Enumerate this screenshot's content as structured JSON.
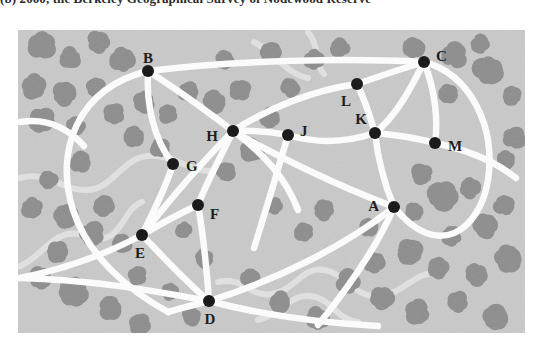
{
  "caption": "(b)  2000, the Berkeley Geographical Survey of Nodewood Reserve",
  "colors": {
    "page_background": "#ffffff",
    "map_background": "#c9c9c9",
    "road": "#ffffff",
    "stream": "#e2e2e2",
    "tree": "#8d8d8d",
    "node": "#101010",
    "label": "#141414"
  },
  "map": {
    "title": "road-network-map",
    "width": 507,
    "height": 303,
    "nodes": [
      {
        "id": "A",
        "label": "A",
        "x": 376,
        "y": 177,
        "label_dx": -15,
        "label_dy": 1,
        "degree": 5
      },
      {
        "id": "B",
        "label": "B",
        "x": 130,
        "y": 41,
        "label_dx": 0,
        "label_dy": -11,
        "degree": 4
      },
      {
        "id": "C",
        "label": "C",
        "x": 406,
        "y": 32,
        "label_dx": 12,
        "label_dy": -4,
        "degree": 5
      },
      {
        "id": "D",
        "label": "D",
        "x": 191,
        "y": 271,
        "label_dx": 1,
        "label_dy": 20,
        "degree": 4
      },
      {
        "id": "E",
        "label": "E",
        "x": 124,
        "y": 205,
        "label_dx": -2,
        "label_dy": 20,
        "degree": 5
      },
      {
        "id": "F",
        "label": "F",
        "x": 180,
        "y": 175,
        "label_dx": 12,
        "label_dy": 11,
        "degree": 2
      },
      {
        "id": "G",
        "label": "G",
        "x": 155,
        "y": 134,
        "label_dx": 13,
        "label_dy": 4,
        "degree": 2
      },
      {
        "id": "H",
        "label": "H",
        "x": 215,
        "y": 101,
        "label_dx": -15,
        "label_dy": 7,
        "degree": 7
      },
      {
        "id": "J",
        "label": "J",
        "x": 270,
        "y": 105,
        "label_dx": 12,
        "label_dy": -2,
        "degree": 3
      },
      {
        "id": "K",
        "label": "K",
        "x": 357,
        "y": 103,
        "label_dx": -8,
        "label_dy": -12,
        "degree": 4
      },
      {
        "id": "L",
        "label": "L",
        "x": 339,
        "y": 54,
        "label_dx": -6,
        "label_dy": 19,
        "degree": 3
      },
      {
        "id": "M",
        "label": "M",
        "x": 417,
        "y": 113,
        "label_dx": 13,
        "label_dy": 5,
        "degree": 3
      }
    ],
    "roads": [
      {
        "name": "B-H",
        "d": "M130,41 C160,60 190,82 215,101"
      },
      {
        "name": "B-C",
        "d": "M130,41 C220,30 330,28 406,32"
      },
      {
        "name": "B-E-arc",
        "d": "M130,41 C60,58 36,120 55,180 C70,226 110,260 150,282"
      },
      {
        "name": "B-G-E",
        "d": "M130,41 C128,75 136,110 155,134 C148,158 134,184 124,205"
      },
      {
        "name": "H-J",
        "d": "M215,101 C236,100 254,102 270,105"
      },
      {
        "name": "J-K",
        "d": "M270,105 C300,114 330,112 357,103"
      },
      {
        "name": "K-M",
        "d": "M357,103 C380,105 402,109 417,113"
      },
      {
        "name": "K-L",
        "d": "M357,103 C352,86 346,68 339,54"
      },
      {
        "name": "L-C",
        "d": "M339,54 C362,46 386,38 406,32"
      },
      {
        "name": "H-L",
        "d": "M215,101 C250,78 296,60 339,54"
      },
      {
        "name": "C-M",
        "d": "M406,32 C418,62 420,92 417,113"
      },
      {
        "name": "C-A-right",
        "d": "M406,32 C452,44 478,96 470,150 C462,200 420,232 376,177"
      },
      {
        "name": "C-K-A",
        "d": "M406,32 C392,60 378,86 357,103 C360,130 368,158 376,177"
      },
      {
        "name": "H-A",
        "d": "M215,101 C258,126 320,156 376,177"
      },
      {
        "name": "A-D",
        "d": "M376,177 C330,214 260,250 191,271"
      },
      {
        "name": "A-south",
        "d": "M376,177 C360,215 330,258 300,295"
      },
      {
        "name": "H-F-D",
        "d": "M215,101 C200,132 188,154 180,175 C186,208 189,244 191,271"
      },
      {
        "name": "H-E",
        "d": "M215,101 C186,130 150,172 124,205"
      },
      {
        "name": "E-F",
        "d": "M124,205 C142,194 163,183 180,175"
      },
      {
        "name": "E-D",
        "d": "M124,205 C148,230 170,254 191,271"
      },
      {
        "name": "E-W",
        "d": "M124,205 C92,222 52,238 2,248"
      },
      {
        "name": "D-W",
        "d": "M191,271 C140,262 80,250 2,248"
      },
      {
        "name": "D-E-arc2",
        "d": "M150,282 C165,278 178,274 191,271"
      },
      {
        "name": "D-SE",
        "d": "M191,271 C240,284 290,292 360,296"
      },
      {
        "name": "H-J-lower",
        "d": "M215,101 C246,124 268,148 280,180"
      },
      {
        "name": "J-south",
        "d": "M270,105 C260,140 248,180 236,218"
      },
      {
        "name": "M-east",
        "d": "M417,113 C450,120 478,132 498,148"
      },
      {
        "name": "left-edge-arc",
        "d": "M2,92 C26,88 48,96 66,116"
      }
    ],
    "streams": [
      {
        "name": "stream-northwest",
        "d": "M2,148 C30,140 46,162 70,160 C96,158 104,128 130,126 C158,124 176,146 200,140"
      },
      {
        "name": "stream-west-lower",
        "d": "M2,236 C22,228 30,208 50,204 C70,200 78,214 92,206 C106,198 108,178 124,172"
      },
      {
        "name": "stream-southeast",
        "d": "M200,252 C226,246 232,268 254,264 C278,260 284,236 306,240 C330,244 336,268 360,266 C388,264 396,240 420,244"
      },
      {
        "name": "stream-se-lower",
        "d": "M240,290 C264,284 272,264 292,266 C314,268 318,290 340,292"
      },
      {
        "name": "stream-north-center",
        "d": "M236,12 C256,22 268,44 290,48"
      },
      {
        "name": "stream-topright",
        "d": "M290,2 C302,16 296,34 306,44"
      }
    ],
    "tree_clusters": [
      {
        "x": 24,
        "y": 16,
        "r": 13
      },
      {
        "x": 52,
        "y": 28,
        "r": 10
      },
      {
        "x": 80,
        "y": 12,
        "r": 11
      },
      {
        "x": 104,
        "y": 30,
        "r": 12
      },
      {
        "x": 16,
        "y": 56,
        "r": 12
      },
      {
        "x": 46,
        "y": 64,
        "r": 11
      },
      {
        "x": 78,
        "y": 58,
        "r": 9
      },
      {
        "x": 24,
        "y": 90,
        "r": 12
      },
      {
        "x": 58,
        "y": 96,
        "r": 9
      },
      {
        "x": 96,
        "y": 84,
        "r": 10
      },
      {
        "x": 126,
        "y": 72,
        "r": 10
      },
      {
        "x": 150,
        "y": 84,
        "r": 9
      },
      {
        "x": 170,
        "y": 62,
        "r": 10
      },
      {
        "x": 196,
        "y": 72,
        "r": 11
      },
      {
        "x": 222,
        "y": 60,
        "r": 10
      },
      {
        "x": 206,
        "y": 30,
        "r": 9
      },
      {
        "x": 252,
        "y": 22,
        "r": 10
      },
      {
        "x": 272,
        "y": 58,
        "r": 9
      },
      {
        "x": 296,
        "y": 30,
        "r": 10
      },
      {
        "x": 322,
        "y": 18,
        "r": 9
      },
      {
        "x": 252,
        "y": 88,
        "r": 10
      },
      {
        "x": 234,
        "y": 120,
        "r": 11
      },
      {
        "x": 208,
        "y": 142,
        "r": 9
      },
      {
        "x": 116,
        "y": 106,
        "r": 10
      },
      {
        "x": 142,
        "y": 118,
        "r": 9
      },
      {
        "x": 62,
        "y": 132,
        "r": 10
      },
      {
        "x": 30,
        "y": 150,
        "r": 9
      },
      {
        "x": 14,
        "y": 178,
        "r": 10
      },
      {
        "x": 48,
        "y": 186,
        "r": 11
      },
      {
        "x": 86,
        "y": 176,
        "r": 10
      },
      {
        "x": 74,
        "y": 204,
        "r": 12
      },
      {
        "x": 104,
        "y": 214,
        "r": 9
      },
      {
        "x": 40,
        "y": 222,
        "r": 10
      },
      {
        "x": 22,
        "y": 248,
        "r": 11
      },
      {
        "x": 56,
        "y": 262,
        "r": 14
      },
      {
        "x": 92,
        "y": 278,
        "r": 11
      },
      {
        "x": 120,
        "y": 246,
        "r": 9
      },
      {
        "x": 152,
        "y": 262,
        "r": 8
      },
      {
        "x": 396,
        "y": 18,
        "r": 10
      },
      {
        "x": 436,
        "y": 26,
        "r": 13
      },
      {
        "x": 470,
        "y": 40,
        "r": 14
      },
      {
        "x": 430,
        "y": 64,
        "r": 9
      },
      {
        "x": 462,
        "y": 14,
        "r": 9
      },
      {
        "x": 404,
        "y": 144,
        "r": 10
      },
      {
        "x": 424,
        "y": 166,
        "r": 14
      },
      {
        "x": 452,
        "y": 158,
        "r": 10
      },
      {
        "x": 396,
        "y": 182,
        "r": 9
      },
      {
        "x": 468,
        "y": 196,
        "r": 12
      },
      {
        "x": 434,
        "y": 206,
        "r": 10
      },
      {
        "x": 486,
        "y": 176,
        "r": 10
      },
      {
        "x": 490,
        "y": 228,
        "r": 13
      },
      {
        "x": 458,
        "y": 244,
        "r": 11
      },
      {
        "x": 420,
        "y": 238,
        "r": 10
      },
      {
        "x": 392,
        "y": 222,
        "r": 12
      },
      {
        "x": 356,
        "y": 232,
        "r": 10
      },
      {
        "x": 330,
        "y": 252,
        "r": 12
      },
      {
        "x": 364,
        "y": 268,
        "r": 11
      },
      {
        "x": 400,
        "y": 282,
        "r": 12
      },
      {
        "x": 440,
        "y": 272,
        "r": 10
      },
      {
        "x": 478,
        "y": 288,
        "r": 12
      },
      {
        "x": 300,
        "y": 288,
        "r": 11
      },
      {
        "x": 262,
        "y": 272,
        "r": 10
      },
      {
        "x": 232,
        "y": 248,
        "r": 9
      },
      {
        "x": 186,
        "y": 228,
        "r": 9
      },
      {
        "x": 166,
        "y": 200,
        "r": 8
      },
      {
        "x": 286,
        "y": 202,
        "r": 9
      },
      {
        "x": 306,
        "y": 180,
        "r": 10
      },
      {
        "x": 256,
        "y": 176,
        "r": 8
      },
      {
        "x": 350,
        "y": 198,
        "r": 9
      },
      {
        "x": 496,
        "y": 108,
        "r": 11
      },
      {
        "x": 494,
        "y": 66,
        "r": 9
      },
      {
        "x": 174,
        "y": 286,
        "r": 9
      },
      {
        "x": 122,
        "y": 294,
        "r": 10
      },
      {
        "x": 488,
        "y": 130,
        "r": 9
      }
    ]
  }
}
